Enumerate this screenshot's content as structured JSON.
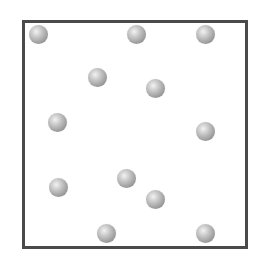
{
  "diagram": {
    "container": {
      "border_color": "#4a4a4a",
      "background": "#ffffff"
    },
    "sphere_color": "#a0a0a0",
    "particles": [
      {
        "x": 38,
        "y": 34
      },
      {
        "x": 136,
        "y": 34
      },
      {
        "x": 205,
        "y": 34
      },
      {
        "x": 97,
        "y": 77
      },
      {
        "x": 155,
        "y": 88
      },
      {
        "x": 57,
        "y": 122
      },
      {
        "x": 205,
        "y": 131
      },
      {
        "x": 58,
        "y": 187
      },
      {
        "x": 126,
        "y": 178
      },
      {
        "x": 155,
        "y": 199
      },
      {
        "x": 106,
        "y": 233
      },
      {
        "x": 205,
        "y": 233
      }
    ],
    "particle_count": 12
  }
}
